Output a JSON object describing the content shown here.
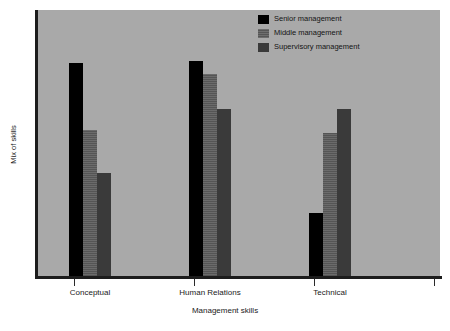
{
  "chart_data": {
    "type": "bar",
    "title": "",
    "subtitle": "",
    "xlabel": "Management skills",
    "ylabel": "Mix of skills",
    "categories": [
      "Conceptual",
      "Human Relations",
      "Technical"
    ],
    "grid": false,
    "legend_position": "top-right",
    "ylim": [
      0,
      100
    ],
    "xtick_labels": [
      "Conceptual",
      "Human Relations",
      "Technical"
    ],
    "ytick_labels": [],
    "series": [
      {
        "name": "Senior management",
        "color": "#000000",
        "values": [
          80,
          81,
          24
        ]
      },
      {
        "name": "Middle management",
        "color": "#5a5a5a",
        "values": [
          55,
          76,
          54
        ]
      },
      {
        "name": "Supervisory management",
        "color": "#3a3a3a",
        "values": [
          39,
          63,
          63
        ]
      }
    ],
    "annotations": []
  },
  "legend": {
    "items": [
      {
        "label": "Senior management",
        "color": "#000000"
      },
      {
        "label": "Middle management",
        "color": "#5a5a5a"
      },
      {
        "label": "Supervisory management",
        "color": "#3a3a3a"
      }
    ]
  },
  "colors": {
    "plot_background": "#a9a9a9",
    "page_background": "#ffffff",
    "axis": "#1c1c1c",
    "text": "#1a1a1a"
  }
}
